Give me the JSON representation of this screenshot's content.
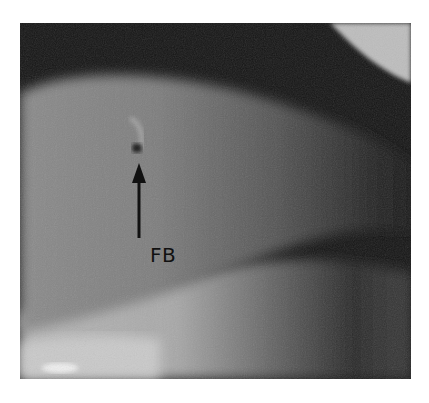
{
  "figure": {
    "type": "clinical photograph (grayscale)",
    "annotation": {
      "label": "FB",
      "arrow_direction": "up",
      "points_to": "dark spot (foreign body)"
    },
    "colors": {
      "background": "#ffffff",
      "arrow": "#111111",
      "label": "#111111"
    }
  }
}
